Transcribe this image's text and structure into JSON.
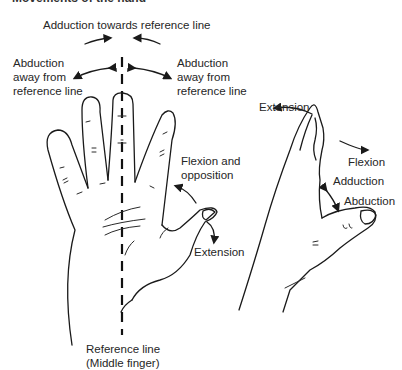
{
  "title": "Movements of the hand",
  "left_hand": {
    "labels": {
      "adduction_towards": "Adduction towards reference line",
      "abduction_left_1": "Abduction",
      "abduction_left_2": "away from",
      "abduction_left_3": "reference line",
      "abduction_right_1": "Abduction",
      "abduction_right_2": "away from",
      "abduction_right_3": "reference line",
      "flexion_opposition_1": "Flexion and",
      "flexion_opposition_2": "opposition",
      "extension": "Extension",
      "reference_1": "Reference line",
      "reference_2": "(Middle finger)"
    }
  },
  "right_hand": {
    "labels": {
      "extension": "Extension",
      "flexion": "Flexion",
      "adduction": "Adduction",
      "abduction": "Abduction"
    }
  }
}
